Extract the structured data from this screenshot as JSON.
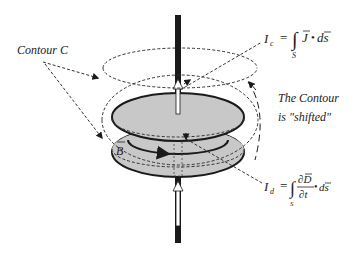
{
  "diagram": {
    "type": "physics-illustration",
    "labels": {
      "contour": "Contour C",
      "shifted_line1": "The Contour",
      "shifted_line2": "is \"shifted\"",
      "b_field": "B"
    },
    "equations": {
      "conduction": {
        "lhs": "I",
        "lhs_sub": "c",
        "equals": "=",
        "integral": "∫",
        "integral_sub": "S",
        "integrand": "J",
        "dot": "•",
        "ds": "ds"
      },
      "displacement": {
        "lhs": "I",
        "lhs_sub": "d",
        "equals": "=",
        "integral": "∫",
        "integral_sub": "S",
        "numerator": "∂D",
        "denominator": "∂t",
        "dot": "•",
        "ds": "ds"
      }
    },
    "colors": {
      "wire": "#1a1a1a",
      "plate_fill": "#c8c8c8",
      "plate_stroke": "#1a1a1a",
      "dashed": "#333333",
      "text": "#222222"
    }
  }
}
